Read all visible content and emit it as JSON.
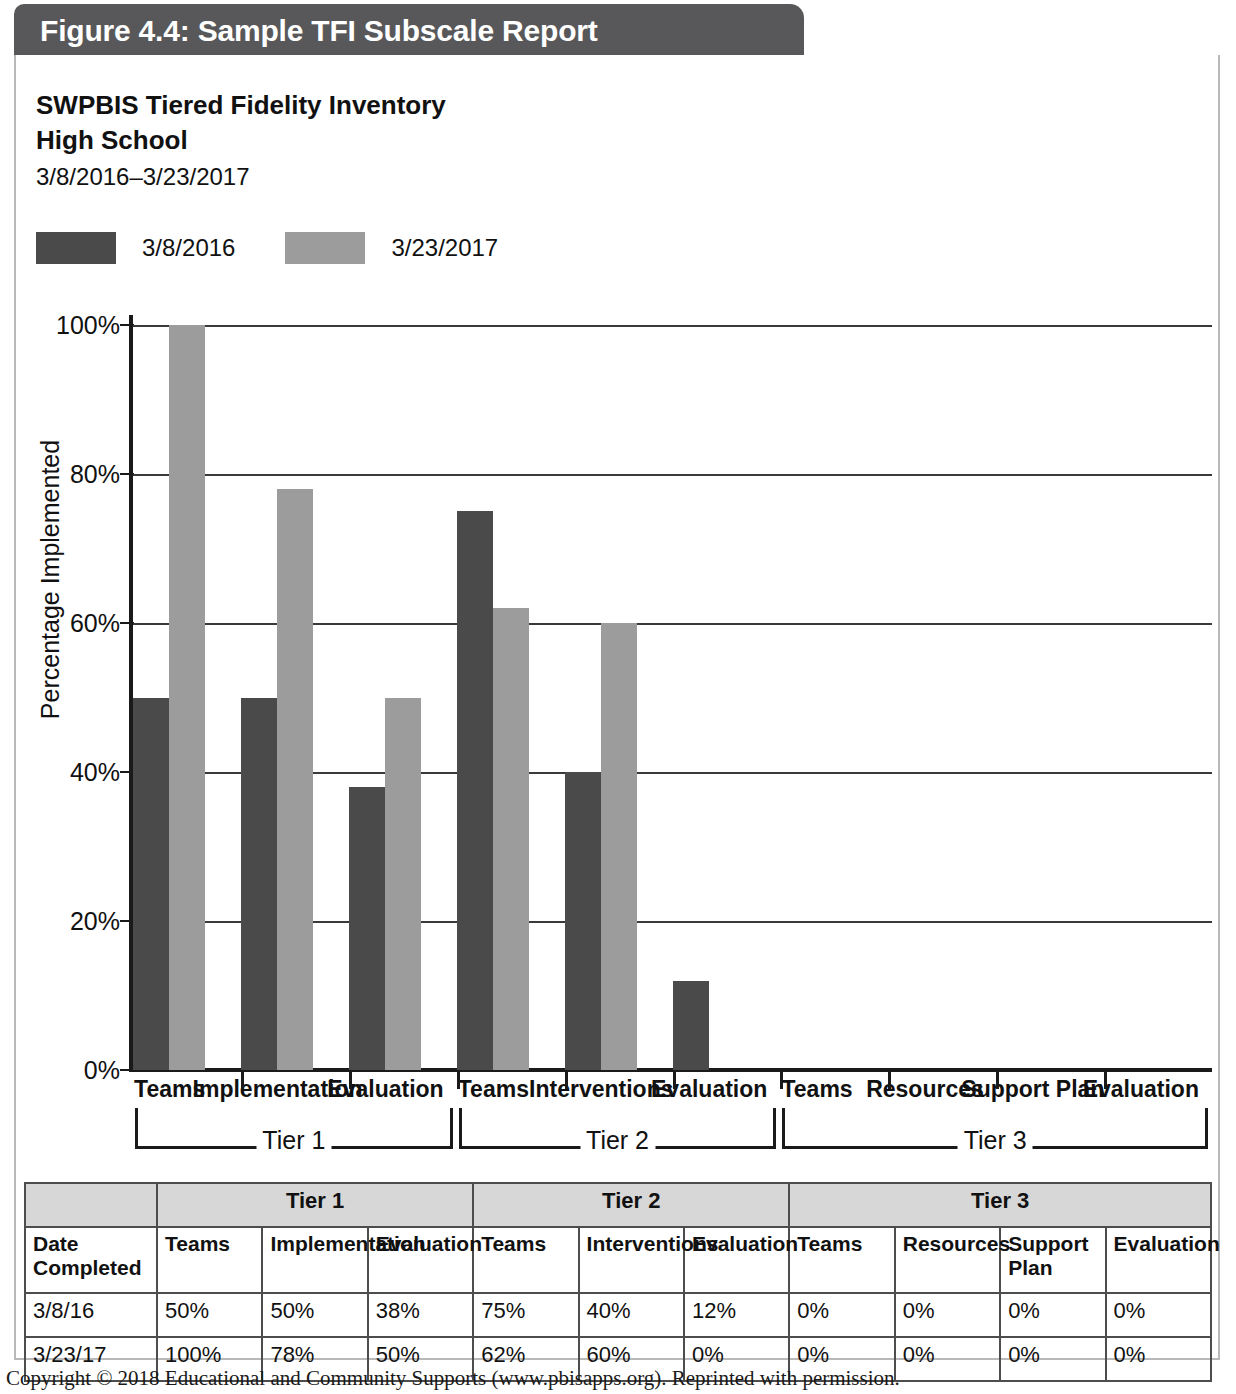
{
  "figure": {
    "header_title": "Figure 4.4: Sample TFI Subscale Report",
    "title_line1": "SWPBIS Tiered Fidelity Inventory",
    "title_line2": "High School",
    "date_range": "3/8/2016–3/23/2017",
    "copyright": "Copyright © 2018 Educational and Community Supports (www.pbisapps.org). Reprinted with permission."
  },
  "colors": {
    "header_bar": "#58585a",
    "series1": "#4a4a4a",
    "series2": "#9c9c9c",
    "table_header": "#d7d7d7",
    "frame": "#b9b9b9"
  },
  "chart_data": {
    "type": "bar",
    "title": "SWPBIS Tiered Fidelity Inventory",
    "subtitle": "High School",
    "xlabel": "",
    "ylabel": "Percentage Implemented",
    "ylim": [
      0,
      100
    ],
    "yticks": [
      "0%",
      "20%",
      "40%",
      "60%",
      "80%",
      "100%"
    ],
    "ytick_values": [
      0,
      20,
      40,
      60,
      80,
      100
    ],
    "grid": true,
    "legend_position": "top-left",
    "categories": [
      "Teams",
      "Implementation",
      "Evaluation",
      "Teams",
      "Interventions",
      "Evaluation",
      "Teams",
      "Resources",
      "Support Plan",
      "Evaluation"
    ],
    "groups": [
      {
        "label": "Tier 1",
        "categories": [
          "Teams",
          "Implementation",
          "Evaluation"
        ]
      },
      {
        "label": "Tier 2",
        "categories": [
          "Teams",
          "Interventions",
          "Evaluation"
        ]
      },
      {
        "label": "Tier 3",
        "categories": [
          "Teams",
          "Resources",
          "Support Plan",
          "Evaluation"
        ]
      }
    ],
    "series": [
      {
        "name": "3/8/2016",
        "color": "#4a4a4a",
        "values": [
          50,
          50,
          38,
          75,
          40,
          12,
          0,
          0,
          0,
          0
        ]
      },
      {
        "name": "3/23/2017",
        "color": "#9c9c9c",
        "values": [
          100,
          78,
          50,
          62,
          60,
          0,
          0,
          0,
          0,
          0
        ]
      }
    ]
  },
  "legend": {
    "items": [
      {
        "label": "3/8/2016",
        "color": "#4a4a4a"
      },
      {
        "label": "3/23/2017",
        "color": "#9c9c9c"
      }
    ]
  },
  "table": {
    "tier_header": [
      "",
      "Tier 1",
      "Tier 2",
      "Tier 3"
    ],
    "columns": [
      "Date Completed",
      "Teams",
      "Implementation",
      "Evaluation",
      "Teams",
      "Interventions",
      "Evaluation",
      "Teams",
      "Resources",
      "Support Plan",
      "Evaluation"
    ],
    "rows": [
      {
        "date": "3/8/16",
        "values": [
          "50%",
          "50%",
          "38%",
          "75%",
          "40%",
          "12%",
          "0%",
          "0%",
          "0%",
          "0%"
        ]
      },
      {
        "date": "3/23/17",
        "values": [
          "100%",
          "78%",
          "50%",
          "62%",
          "60%",
          "0%",
          "0%",
          "0%",
          "0%",
          "0%"
        ]
      }
    ]
  }
}
